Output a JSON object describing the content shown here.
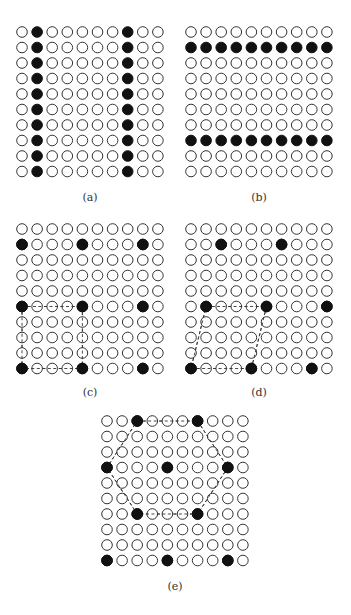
{
  "figure": {
    "grid_size": 10,
    "panels": [
      {
        "id": "a",
        "caption": "(a)",
        "origin": [
          22,
          32
        ],
        "spacing": [
          15.1,
          15.5
        ],
        "caption_pos": [
          90,
          201
        ],
        "filled": [
          [
            0,
            1
          ],
          [
            1,
            1
          ],
          [
            2,
            1
          ],
          [
            3,
            1
          ],
          [
            4,
            1
          ],
          [
            5,
            1
          ],
          [
            6,
            1
          ],
          [
            7,
            1
          ],
          [
            8,
            1
          ],
          [
            9,
            1
          ],
          [
            0,
            7
          ],
          [
            1,
            7
          ],
          [
            2,
            7
          ],
          [
            3,
            7
          ],
          [
            4,
            7
          ],
          [
            5,
            7
          ],
          [
            6,
            7
          ],
          [
            7,
            7
          ],
          [
            8,
            7
          ],
          [
            9,
            7
          ]
        ],
        "polygon": []
      },
      {
        "id": "b",
        "caption": "(b)",
        "origin": [
          191,
          32
        ],
        "spacing": [
          15.1,
          15.5
        ],
        "caption_pos": [
          259,
          201
        ],
        "filled": [
          [
            1,
            0
          ],
          [
            1,
            1
          ],
          [
            1,
            2
          ],
          [
            1,
            3
          ],
          [
            1,
            4
          ],
          [
            1,
            5
          ],
          [
            1,
            6
          ],
          [
            1,
            7
          ],
          [
            1,
            8
          ],
          [
            1,
            9
          ],
          [
            7,
            0
          ],
          [
            7,
            1
          ],
          [
            7,
            2
          ],
          [
            7,
            3
          ],
          [
            7,
            4
          ],
          [
            7,
            5
          ],
          [
            7,
            6
          ],
          [
            7,
            7
          ],
          [
            7,
            8
          ],
          [
            7,
            9
          ]
        ],
        "polygon": []
      },
      {
        "id": "c",
        "caption": "(c)",
        "origin": [
          22,
          229
        ],
        "spacing": [
          15.1,
          15.5
        ],
        "caption_pos": [
          90,
          396
        ],
        "filled": [
          [
            1,
            0
          ],
          [
            1,
            4
          ],
          [
            1,
            8
          ],
          [
            5,
            0
          ],
          [
            5,
            4
          ],
          [
            5,
            8
          ],
          [
            9,
            0
          ],
          [
            9,
            4
          ],
          [
            9,
            8
          ]
        ],
        "polygon": [
          [
            5,
            0
          ],
          [
            5,
            4
          ],
          [
            9,
            4
          ],
          [
            9,
            0
          ]
        ]
      },
      {
        "id": "d",
        "caption": "(d)",
        "origin": [
          191,
          229
        ],
        "spacing": [
          15.1,
          15.5
        ],
        "caption_pos": [
          259,
          396
        ],
        "filled": [
          [
            1,
            2
          ],
          [
            1,
            6
          ],
          [
            5,
            1
          ],
          [
            5,
            5
          ],
          [
            5,
            9
          ],
          [
            9,
            0
          ],
          [
            9,
            4
          ],
          [
            9,
            8
          ]
        ],
        "polygon": [
          [
            5,
            1
          ],
          [
            5,
            5
          ],
          [
            9,
            4
          ],
          [
            9,
            0
          ]
        ]
      },
      {
        "id": "e",
        "caption": "(e)",
        "origin": [
          107,
          421
        ],
        "spacing": [
          15.1,
          15.5
        ],
        "caption_pos": [
          175,
          590
        ],
        "filled": [
          [
            0,
            2
          ],
          [
            0,
            6
          ],
          [
            3,
            0
          ],
          [
            3,
            4
          ],
          [
            3,
            8
          ],
          [
            6,
            2
          ],
          [
            6,
            6
          ],
          [
            9,
            0
          ],
          [
            9,
            4
          ],
          [
            9,
            8
          ]
        ],
        "polygon": [
          [
            0,
            2
          ],
          [
            0,
            6
          ],
          [
            3,
            8
          ],
          [
            6,
            6
          ],
          [
            6,
            2
          ],
          [
            3,
            0
          ]
        ]
      }
    ]
  }
}
